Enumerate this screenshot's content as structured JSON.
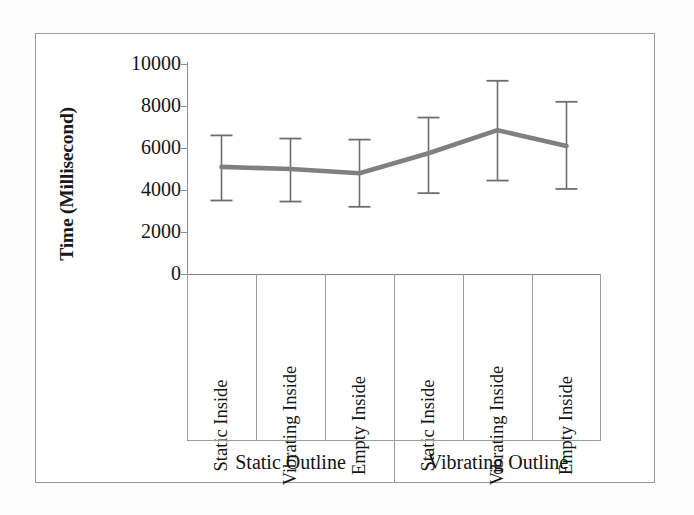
{
  "chart_data": {
    "type": "line",
    "title": "",
    "xlabel": "",
    "ylabel": "Time (Millisecond)",
    "ylim": [
      0,
      10000
    ],
    "ytick_labels": [
      "10000",
      "8000",
      "6000",
      "4000",
      "2000",
      "0"
    ],
    "yticks": [
      10000,
      8000,
      6000,
      4000,
      2000,
      0
    ],
    "grid": false,
    "legend": "none",
    "categories": [
      "Static Inside",
      "Vibrating Inside",
      "Empty Inside",
      "Static Inside",
      "Vibrating Inside",
      "Empty Inside"
    ],
    "groups": [
      {
        "label": "Static Outline",
        "categories": [
          "Static Inside",
          "Vibrating Inside",
          "Empty Inside"
        ]
      },
      {
        "label": "Vibrating Outline",
        "categories": [
          "Static Inside",
          "Vibrating Inside",
          "Empty Inside"
        ]
      }
    ],
    "series": [
      {
        "name": "Mean time",
        "color": "#808080",
        "values": [
          5100,
          5000,
          4800,
          5750,
          6850,
          6100
        ],
        "error_low": [
          3500,
          3450,
          3200,
          3850,
          4450,
          4050
        ],
        "error_high": [
          6600,
          6450,
          6400,
          7450,
          9200,
          8200
        ]
      }
    ],
    "error_bars": {
      "style": "capped-whisker",
      "color": "#6e6e6e"
    },
    "points": [
      {
        "group": "Static Outline",
        "category": "Static Inside",
        "value": 5100,
        "low": 3500,
        "high": 6600
      },
      {
        "group": "Static Outline",
        "category": "Vibrating Inside",
        "value": 5000,
        "low": 3450,
        "high": 6450
      },
      {
        "group": "Static Outline",
        "category": "Empty Inside",
        "value": 4800,
        "low": 3200,
        "high": 6400
      },
      {
        "group": "Vibrating Outline",
        "category": "Static Inside",
        "value": 5750,
        "low": 3850,
        "high": 7450
      },
      {
        "group": "Vibrating Outline",
        "category": "Vibrating Inside",
        "value": 6850,
        "low": 4450,
        "high": 9200
      },
      {
        "group": "Vibrating Outline",
        "category": "Empty Inside",
        "value": 6100,
        "low": 4050,
        "high": 8200
      }
    ]
  },
  "colors": {
    "series_line": "#808080",
    "error_bar": "#6e6e6e",
    "axis": "#8d8d8d",
    "frame": "#9a9a9a",
    "text": "#151515",
    "background": "#ffffff"
  }
}
